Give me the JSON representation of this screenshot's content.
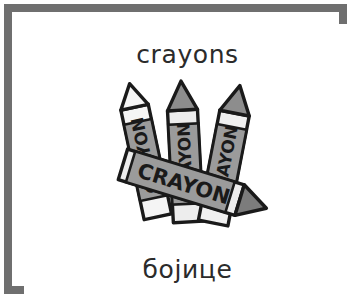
{
  "card": {
    "background_color": "#ffffff",
    "border_color": "#6f6f6f",
    "text_color": "#2b2b2b"
  },
  "labels": {
    "english": "crayons",
    "serbian": "бојице"
  },
  "illustration": {
    "name": "crayons-clipart",
    "palette": {
      "outline": "#1a1a1a",
      "light": "#f2f2f2",
      "mid": "#9b9b9b",
      "dark": "#6e6e6e",
      "wrapper": "#efefef"
    },
    "crayons": [
      {
        "id": "crayon-left",
        "wrapper_text": "CRAYON"
      },
      {
        "id": "crayon-middle",
        "wrapper_text": "CRAYON"
      },
      {
        "id": "crayon-right",
        "wrapper_text": "CRAYON"
      },
      {
        "id": "crayon-diagonal",
        "wrapper_text": "CRAYON"
      }
    ]
  }
}
